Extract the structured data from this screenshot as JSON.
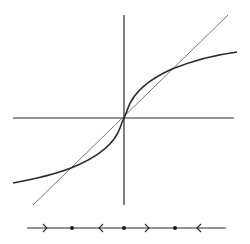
{
  "diagram": {
    "type": "phase-diagram",
    "background": "#ffffff",
    "ink_color": "#2a2a2a",
    "thin_ink_color": "#555555",
    "axes": {
      "origin": [
        124,
        118
      ],
      "x_axis": {
        "from": [
          13,
          118
        ],
        "to": [
          234,
          118
        ]
      },
      "y_axis": {
        "from": [
          124,
          15
        ],
        "to": [
          124,
          205
        ]
      }
    },
    "diagonal_line": {
      "label": "y = x",
      "from": [
        33,
        205
      ],
      "to": [
        228,
        15
      ]
    },
    "s_curve": {
      "label": "f(x)",
      "path": "M13,183 C40,178 58,173 71,168 C96,158 114,145 120,128 C122,122 123,120 124,118 C125,116 126,114 128,108 C134,91 152,78 172,69 C192,61 214,55 237,52"
    },
    "intersections": [
      {
        "name": "lower-fixed-point",
        "x": 71,
        "y": 168
      },
      {
        "name": "origin-fixed-point",
        "x": 124,
        "y": 118
      },
      {
        "name": "upper-fixed-point",
        "x": 172,
        "y": 69
      }
    ],
    "phase_line": {
      "y": 228,
      "from_x": 27,
      "to_x": 226,
      "equilibria": [
        {
          "name": "lower-equilibrium",
          "x": 72
        },
        {
          "name": "zero-equilibrium",
          "x": 124
        },
        {
          "name": "upper-equilibrium",
          "x": 175
        }
      ],
      "arrows": [
        {
          "name": "arrow-right-1",
          "x": 46,
          "direction": "right"
        },
        {
          "name": "arrow-left-1",
          "x": 100,
          "direction": "left"
        },
        {
          "name": "arrow-right-2",
          "x": 148,
          "direction": "right"
        },
        {
          "name": "arrow-left-2",
          "x": 198,
          "direction": "left"
        }
      ]
    }
  }
}
